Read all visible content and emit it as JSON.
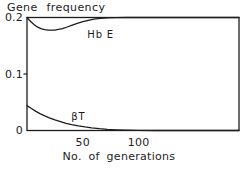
{
  "chart_data": {
    "type": "line",
    "title": "Gene frequency",
    "xlabel": "No. of generations",
    "ylabel": "Gene frequency",
    "xlim": [
      0,
      190
    ],
    "ylim": [
      0,
      0.2
    ],
    "grid": false,
    "legend_position": "inline-curve-labels",
    "background": "#ffffff",
    "line_color": "#1c1c1c",
    "x_ticks": [
      {
        "value": 50,
        "label": "50"
      },
      {
        "value": 100,
        "label": "100"
      }
    ],
    "y_ticks": [
      {
        "value": 0.2,
        "label": "0.2",
        "tick": false
      },
      {
        "value": 0.1,
        "label": "0.1",
        "tick": true
      },
      {
        "value": 0,
        "label": "0",
        "tick": false
      }
    ],
    "series": [
      {
        "name": "Hb E",
        "slug": "hb-e",
        "label_at": [
          66,
          0.171
        ],
        "points": [
          [
            0,
            0.2
          ],
          [
            2,
            0.1955
          ],
          [
            4,
            0.1915
          ],
          [
            6,
            0.188
          ],
          [
            8,
            0.185
          ],
          [
            10,
            0.1825
          ],
          [
            13,
            0.18
          ],
          [
            16,
            0.1785
          ],
          [
            19,
            0.1777
          ],
          [
            22,
            0.1775
          ],
          [
            25,
            0.1778
          ],
          [
            28,
            0.1788
          ],
          [
            32,
            0.1805
          ],
          [
            36,
            0.1832
          ],
          [
            40,
            0.186
          ],
          [
            45,
            0.1895
          ],
          [
            50,
            0.1925
          ],
          [
            55,
            0.195
          ],
          [
            60,
            0.197
          ],
          [
            66,
            0.1985
          ],
          [
            72,
            0.1993
          ],
          [
            80,
            0.1998
          ],
          [
            90,
            0.2
          ],
          [
            190,
            0.2
          ]
        ]
      },
      {
        "name": "βT",
        "slug": "beta-t",
        "label_at": [
          46,
          0.026
        ],
        "points": [
          [
            0,
            0.044
          ],
          [
            4,
            0.039
          ],
          [
            8,
            0.0338
          ],
          [
            12,
            0.0295
          ],
          [
            16,
            0.0258
          ],
          [
            20,
            0.0225
          ],
          [
            25,
            0.0188
          ],
          [
            30,
            0.0157
          ],
          [
            35,
            0.0128
          ],
          [
            40,
            0.0105
          ],
          [
            46,
            0.0082
          ],
          [
            52,
            0.0063
          ],
          [
            58,
            0.0047
          ],
          [
            65,
            0.0032
          ],
          [
            72,
            0.0021
          ],
          [
            80,
            0.0012
          ],
          [
            90,
            0.0005
          ],
          [
            100,
            0.0002
          ],
          [
            115,
            0
          ],
          [
            190,
            0
          ]
        ]
      }
    ]
  }
}
